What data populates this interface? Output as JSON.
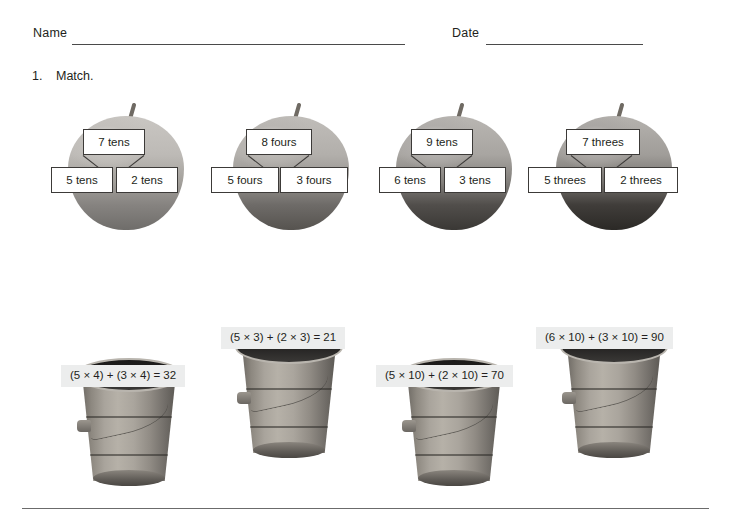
{
  "worksheet": {
    "name_label": "Name",
    "date_label": "Date",
    "problem_number": "1.",
    "instruction": "Match."
  },
  "apples": [
    {
      "total": "7 tens",
      "left": "5 tens",
      "right": "2 tens"
    },
    {
      "total": "8 fours",
      "left": "5 fours",
      "right": "3 fours"
    },
    {
      "total": "9 tens",
      "left": "6 tens",
      "right": "3 tens"
    },
    {
      "total": "7 threes",
      "left": "5 threes",
      "right": "2 threes"
    }
  ],
  "buckets": [
    {
      "equation": "(5 × 4) + (3 × 4) = 32"
    },
    {
      "equation": "(5 × 3) + (2 × 3) = 21"
    },
    {
      "equation": "(5 × 10) + (2 × 10) = 70"
    },
    {
      "equation": "(6 × 10) + (3 × 10) = 90"
    }
  ],
  "colors": {
    "ink": "#231f20",
    "rule": "#4a4a4a",
    "box_border": "#3c3a38",
    "label_background": "#eceded",
    "page_background": "#ffffff"
  }
}
